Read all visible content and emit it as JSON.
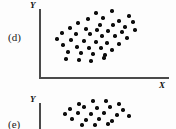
{
  "figure": {
    "kind": "scatterplot-panels",
    "background_color": "#fdfdfd",
    "ink_color": "#0d0d0d",
    "axis_color": "#4a4a4a"
  },
  "panels": [
    {
      "id": "d",
      "label": "(d)",
      "x_axis_label": "X",
      "y_axis_label": "Y",
      "axes": {
        "y_visible": true,
        "x_visible": true
      },
      "chart_data": {
        "type": "scatter",
        "title": "(d)",
        "xlabel": "X",
        "ylabel": "Y",
        "grid": false,
        "legend": "none",
        "relationship": "positive linear correlation",
        "point_count": 42,
        "xlim": [
          0,
          130
        ],
        "ylim": [
          0,
          70
        ],
        "points": [
          [
            96,
            13
          ],
          [
            112,
            11
          ],
          [
            129,
            16
          ],
          [
            88,
            19
          ],
          [
            103,
            18
          ],
          [
            119,
            21
          ],
          [
            133,
            22
          ],
          [
            78,
            23
          ],
          [
            100,
            25
          ],
          [
            113,
            25
          ],
          [
            125,
            27
          ],
          [
            70,
            28
          ],
          [
            86,
            29
          ],
          [
            97,
            30
          ],
          [
            108,
            31
          ],
          [
            122,
            32
          ],
          [
            135,
            30
          ],
          [
            62,
            33
          ],
          [
            76,
            34
          ],
          [
            90,
            34
          ],
          [
            102,
            36
          ],
          [
            115,
            36
          ],
          [
            127,
            38
          ],
          [
            57,
            39
          ],
          [
            71,
            40
          ],
          [
            84,
            41
          ],
          [
            96,
            42
          ],
          [
            107,
            43
          ],
          [
            119,
            44
          ],
          [
            63,
            45
          ],
          [
            77,
            47
          ],
          [
            89,
            48
          ],
          [
            101,
            48
          ],
          [
            112,
            50
          ],
          [
            68,
            52
          ],
          [
            81,
            53
          ],
          [
            93,
            54
          ],
          [
            105,
            55
          ],
          [
            66,
            59
          ],
          [
            79,
            60
          ],
          [
            91,
            61
          ],
          [
            104,
            58
          ]
        ]
      }
    },
    {
      "id": "e",
      "label": "(e)",
      "x_axis_label": "",
      "y_axis_label": "Y",
      "axes": {
        "y_visible": true,
        "x_visible": false
      },
      "chart_data": {
        "type": "scatter",
        "title": "(e)",
        "xlabel": "",
        "ylabel": "Y",
        "grid": false,
        "legend": "none",
        "relationship": "no correlation (horizontal elliptical cloud)",
        "point_count": 22,
        "xlim": [
          0,
          130
        ],
        "ylim": [
          0,
          37
        ],
        "points": [
          [
            79,
            12
          ],
          [
            93,
            9
          ],
          [
            106,
            9
          ],
          [
            119,
            12
          ],
          [
            70,
            17
          ],
          [
            84,
            15
          ],
          [
            97,
            16
          ],
          [
            110,
            15
          ],
          [
            123,
            18
          ],
          [
            65,
            22
          ],
          [
            78,
            21
          ],
          [
            91,
            22
          ],
          [
            104,
            21
          ],
          [
            117,
            23
          ],
          [
            129,
            24
          ],
          [
            72,
            27
          ],
          [
            86,
            28
          ],
          [
            99,
            27
          ],
          [
            112,
            29
          ],
          [
            82,
            33
          ],
          [
            95,
            33
          ],
          [
            108,
            32
          ]
        ]
      }
    }
  ]
}
